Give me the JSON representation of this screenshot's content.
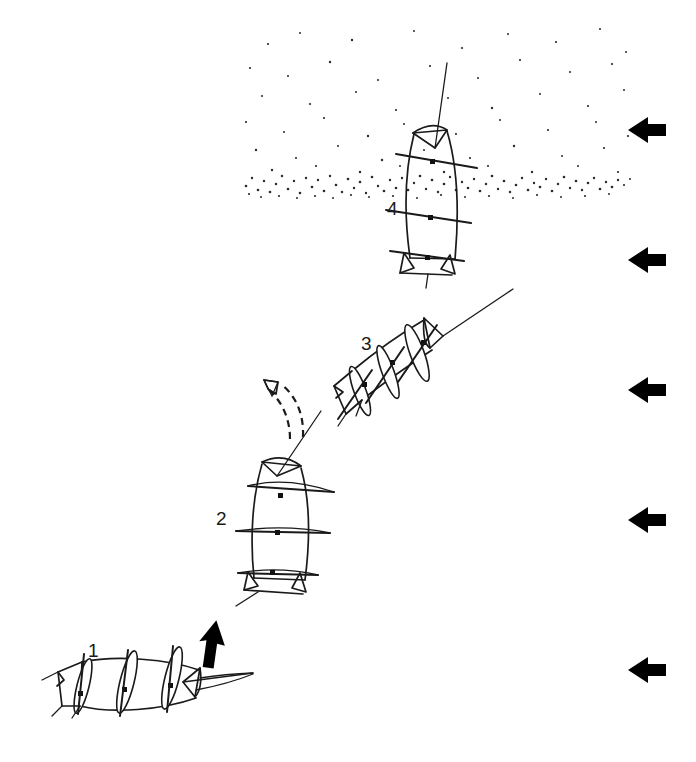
{
  "figure": {
    "background_color": "#ffffff",
    "ink_color": "#1a1a1a",
    "width": 696,
    "height": 762
  },
  "stages": [
    {
      "id": "stage-1",
      "label": "1",
      "label_x": 88,
      "label_y": 657,
      "description": "horizontal resting posture on substrate",
      "body_angle_deg": 95,
      "center_x": 130,
      "center_y": 685
    },
    {
      "id": "stage-2",
      "label": "2",
      "label_x": 216,
      "label_y": 525,
      "description": "body lifted to near vertical, rising",
      "body_angle_deg": 12,
      "center_x": 283,
      "center_y": 525
    },
    {
      "id": "stage-3",
      "label": "3",
      "label_x": 361,
      "label_y": 350,
      "description": "body inclined, moving up and to the right",
      "body_angle_deg": 55,
      "center_x": 412,
      "center_y": 375
    },
    {
      "id": "stage-4",
      "label": "4",
      "label_x": 387,
      "label_y": 215,
      "description": "vertical, crossing the stippled sediment-water interface",
      "body_angle_deg": 7,
      "center_x": 432,
      "center_y": 190
    }
  ],
  "motion_arrows": [
    {
      "id": "motion-arrow-solid",
      "style": "solid",
      "color": "#000000",
      "points_to": "up",
      "near_stage": "1",
      "x": 205,
      "y": 640
    },
    {
      "id": "motion-arrow-dashed",
      "style": "dashed",
      "color": "#1a1a1a",
      "points_to": "up-left",
      "near_stage": "2",
      "x": 277,
      "y": 405
    }
  ],
  "flow_arrows": {
    "count": 5,
    "direction": "left",
    "color": "#000000",
    "positions_y": [
      130,
      260,
      390,
      520,
      670
    ],
    "x": 628,
    "width": 38,
    "height": 26
  },
  "stipple": {
    "name": "sediment-particle-field",
    "color": "#2a2a2a",
    "x_min": 243,
    "x_max": 632,
    "y_min": 26,
    "y_max": 198,
    "dense_band_y": 180,
    "description": "stippled particle cloud, densest in a narrow horizontal band and thinning upward"
  }
}
